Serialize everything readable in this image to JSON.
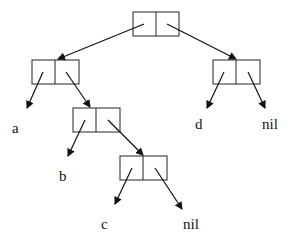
{
  "diagram": {
    "type": "cons-cell tree",
    "nodes": [
      {
        "id": "root",
        "x": 133,
        "y": 12,
        "w": 46,
        "h": 24
      },
      {
        "id": "left",
        "x": 32,
        "y": 60,
        "w": 47,
        "h": 24
      },
      {
        "id": "right",
        "x": 213,
        "y": 60,
        "w": 47,
        "h": 24
      },
      {
        "id": "mid",
        "x": 73,
        "y": 108,
        "w": 47,
        "h": 24
      },
      {
        "id": "bottom",
        "x": 120,
        "y": 156,
        "w": 47,
        "h": 24
      }
    ],
    "leaves": [
      {
        "id": "a",
        "label": "a",
        "x": 16,
        "y": 135
      },
      {
        "id": "b",
        "label": "b",
        "x": 60,
        "y": 183
      },
      {
        "id": "c",
        "label": "c",
        "x": 103,
        "y": 231
      },
      {
        "id": "nil1",
        "label": "nil",
        "x": 185,
        "y": 231
      },
      {
        "id": "d",
        "label": "d",
        "x": 196,
        "y": 135
      },
      {
        "id": "nil2",
        "label": "nil",
        "x": 265,
        "y": 135
      }
    ],
    "edges": [
      {
        "from": "root.car",
        "to": "left"
      },
      {
        "from": "root.cdr",
        "to": "right"
      },
      {
        "from": "left.car",
        "to": "a"
      },
      {
        "from": "left.cdr",
        "to": "mid"
      },
      {
        "from": "right.car",
        "to": "d"
      },
      {
        "from": "right.cdr",
        "to": "nil2"
      },
      {
        "from": "mid.car",
        "to": "b"
      },
      {
        "from": "mid.cdr",
        "to": "bottom"
      },
      {
        "from": "bottom.car",
        "to": "c"
      },
      {
        "from": "bottom.cdr",
        "to": "nil1"
      }
    ]
  }
}
